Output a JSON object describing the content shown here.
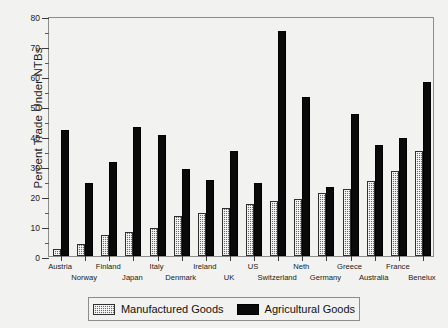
{
  "chart_data": {
    "type": "bar",
    "title": "",
    "xlabel": "",
    "ylabel": "Percent Trade Under NTBs",
    "ylim": [
      0,
      80
    ],
    "ytick_step": 10,
    "yminor_step": 5,
    "grid": false,
    "legend_position": "bottom",
    "categories": [
      "Austria",
      "Norway",
      "Finland",
      "Japan",
      "Italy",
      "Denmark",
      "Ireland",
      "UK",
      "US",
      "Switzerland",
      "Neth",
      "Germany",
      "Greece",
      "Australia",
      "France",
      "Benelux"
    ],
    "ytick_labels": [
      "0",
      "10",
      "20",
      "30",
      "40",
      "50",
      "60",
      "70",
      "80"
    ],
    "ytick_values": [
      0,
      10,
      20,
      30,
      40,
      50,
      60,
      70,
      80
    ],
    "series": [
      {
        "name": "Manufactured Goods",
        "color": "#6b6b6b",
        "pattern": "crosshatch",
        "values": [
          2.5,
          4,
          7,
          8,
          9.5,
          13.5,
          14.5,
          16,
          17.5,
          18.5,
          19,
          21,
          22.5,
          25,
          28.5,
          35
        ]
      },
      {
        "name": "Agricultural Goods",
        "color": "#0a0a0a",
        "pattern": "solid",
        "values": [
          42,
          24.5,
          31.5,
          43,
          40.5,
          29,
          25.5,
          35,
          24.5,
          75,
          53,
          23,
          47.5,
          37,
          39.5,
          58
        ]
      }
    ]
  },
  "legend": {
    "entries": [
      {
        "label": "Manufactured Goods",
        "swatch": "crosshatch-swatch"
      },
      {
        "label": "Agricultural Goods",
        "swatch": "solid-black-swatch"
      }
    ]
  }
}
